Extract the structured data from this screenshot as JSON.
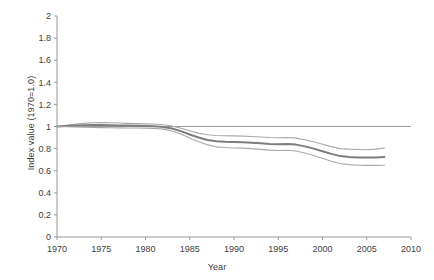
{
  "chart_data": {
    "type": "line",
    "title": "",
    "xlabel": "Year",
    "ylabel": "Index value (1970=1.0)",
    "xlim": [
      1970,
      2010
    ],
    "ylim": [
      0,
      2
    ],
    "xticks": [
      "1970",
      "1975",
      "1980",
      "1985",
      "1990",
      "1995",
      "2000",
      "2005",
      "2010"
    ],
    "yticks": [
      "0",
      "0.2",
      "0.4",
      "0.6",
      "0.8",
      "1",
      "1.2",
      "1.4",
      "1.6",
      "1.8",
      "2"
    ],
    "grid": false,
    "legend": "none",
    "reference_line": {
      "y": 1.0,
      "label": "",
      "color": "#9a9a9a"
    },
    "x": [
      1970,
      1971,
      1972,
      1973,
      1974,
      1975,
      1976,
      1977,
      1978,
      1979,
      1980,
      1981,
      1982,
      1983,
      1984,
      1985,
      1986,
      1987,
      1988,
      1989,
      1990,
      1991,
      1992,
      1993,
      1994,
      1995,
      1996,
      1997,
      1998,
      1999,
      2000,
      2001,
      2002,
      2003,
      2004,
      2005,
      2006,
      2007
    ],
    "series": [
      {
        "name": "Upper bound",
        "color": "#a8a8a8",
        "width": 1.1,
        "values": [
          1.0,
          1.01,
          1.02,
          1.028,
          1.034,
          1.036,
          1.034,
          1.031,
          1.028,
          1.026,
          1.024,
          1.022,
          1.016,
          1.005,
          0.985,
          0.962,
          0.94,
          0.926,
          0.918,
          0.916,
          0.915,
          0.913,
          0.91,
          0.905,
          0.9,
          0.898,
          0.9,
          0.895,
          0.88,
          0.862,
          0.84,
          0.818,
          0.8,
          0.795,
          0.792,
          0.79,
          0.795,
          0.805
        ]
      },
      {
        "name": "Index value",
        "color": "#7d7d7d",
        "width": 2.0,
        "values": [
          1.0,
          1.004,
          1.008,
          1.011,
          1.013,
          1.013,
          1.012,
          1.01,
          1.008,
          1.006,
          1.004,
          1.002,
          0.996,
          0.982,
          0.958,
          0.928,
          0.9,
          0.878,
          0.866,
          0.862,
          0.86,
          0.858,
          0.854,
          0.848,
          0.842,
          0.84,
          0.842,
          0.836,
          0.82,
          0.8,
          0.776,
          0.752,
          0.732,
          0.724,
          0.72,
          0.719,
          0.72,
          0.724
        ]
      },
      {
        "name": "Lower bound",
        "color": "#a8a8a8",
        "width": 1.1,
        "values": [
          1.0,
          0.998,
          0.996,
          0.994,
          0.992,
          0.99,
          0.989,
          0.988,
          0.987,
          0.986,
          0.985,
          0.983,
          0.976,
          0.96,
          0.932,
          0.896,
          0.862,
          0.834,
          0.816,
          0.81,
          0.806,
          0.804,
          0.8,
          0.793,
          0.786,
          0.783,
          0.785,
          0.778,
          0.76,
          0.738,
          0.712,
          0.686,
          0.665,
          0.655,
          0.65,
          0.648,
          0.648,
          0.65
        ]
      }
    ]
  },
  "axes": {
    "axis_color": "#999999",
    "text_color": "#404040"
  }
}
